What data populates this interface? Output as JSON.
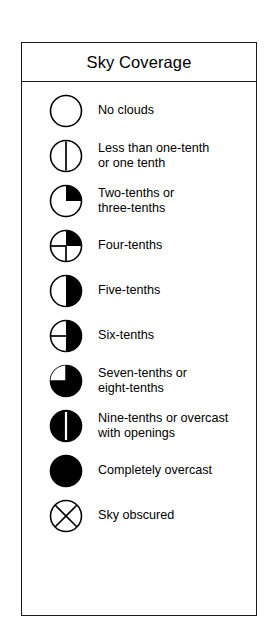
{
  "legend": {
    "title": "Sky Coverage",
    "colors": {
      "ink": "#000000",
      "border": "#1a1a1a",
      "background": "#ffffff"
    },
    "rows": [
      {
        "symbol_name": "sky-coverage-symbol-no-clouds",
        "coverage_eighths": 0,
        "label": "No clouds"
      },
      {
        "symbol_name": "sky-coverage-symbol-one-tenth",
        "coverage_eighths": 1,
        "label": "Less than one-tenth\nor one tenth"
      },
      {
        "symbol_name": "sky-coverage-symbol-two-three-tenths",
        "coverage_eighths": 2,
        "label": "Two-tenths or\nthree-tenths"
      },
      {
        "symbol_name": "sky-coverage-symbol-four-tenths",
        "coverage_eighths": 3,
        "label": "Four-tenths"
      },
      {
        "symbol_name": "sky-coverage-symbol-five-tenths",
        "coverage_eighths": 4,
        "label": "Five-tenths"
      },
      {
        "symbol_name": "sky-coverage-symbol-six-tenths",
        "coverage_eighths": 5,
        "label": "Six-tenths"
      },
      {
        "symbol_name": "sky-coverage-symbol-seven-eight-tenths",
        "coverage_eighths": 6,
        "label": "Seven-tenths or\neight-tenths"
      },
      {
        "symbol_name": "sky-coverage-symbol-nine-tenths",
        "coverage_eighths": 7,
        "label": "Nine-tenths or overcast\nwith openings"
      },
      {
        "symbol_name": "sky-coverage-symbol-overcast",
        "coverage_eighths": 8,
        "label": "Completely overcast"
      },
      {
        "symbol_name": "sky-coverage-symbol-obscured",
        "coverage_eighths": null,
        "label": "Sky obscured"
      }
    ]
  }
}
